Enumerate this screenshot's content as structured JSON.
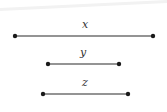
{
  "diagram": {
    "background": "#ffffff",
    "line_color": "#2a2a2a",
    "segments": [
      {
        "label": "x",
        "x1": 15,
        "x2": 153,
        "y": 36,
        "label_x": 85,
        "label_y": 28
      },
      {
        "label": "y",
        "x1": 48,
        "x2": 119,
        "y": 64,
        "label_x": 83,
        "label_y": 56
      },
      {
        "label": "z",
        "x1": 43,
        "x2": 128,
        "y": 94,
        "label_x": 85,
        "label_y": 86
      }
    ]
  }
}
